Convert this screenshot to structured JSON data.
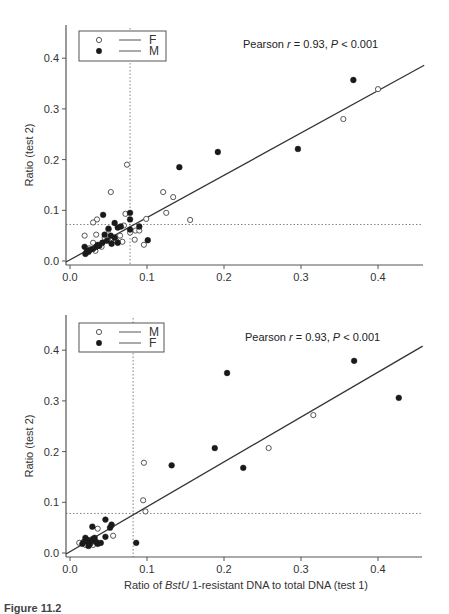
{
  "chart_data": [
    {
      "type": "scatter",
      "title": "",
      "annotation": "Pearson r = 0.93, P < 0.001",
      "annotation_parts": {
        "prefix": "Pearson ",
        "r": "r",
        "r_val": " = 0.93, ",
        "p": "P",
        "p_val": " < 0.001"
      },
      "xlabel": "",
      "ylabel": "Ratio (test 2)",
      "xlim": [
        0,
        0.46
      ],
      "ylim": [
        0,
        0.46
      ],
      "xticks": [
        "0.0",
        "0.1",
        "0.2",
        "0.3",
        "0.4"
      ],
      "yticks": [
        "0.0",
        "0.1",
        "0.2",
        "0.3",
        "0.4"
      ],
      "grid": false,
      "legend_position": "upper left",
      "legend": [
        {
          "label": "F",
          "marker": "open-circle"
        },
        {
          "label": "M",
          "marker": "filled-circle"
        }
      ],
      "cutoff_lines": {
        "x": 0.078,
        "y": 0.072
      },
      "regression_line": {
        "x0": 0.0,
        "y0": 0.0,
        "x1": 0.46,
        "y1": 0.386
      },
      "series": [
        {
          "name": "F",
          "marker": "open",
          "points": [
            [
              0.4,
              0.339
            ],
            [
              0.355,
              0.28
            ],
            [
              0.074,
              0.19
            ],
            [
              0.053,
              0.136
            ],
            [
              0.121,
              0.136
            ],
            [
              0.134,
              0.126
            ],
            [
              0.125,
              0.095
            ],
            [
              0.156,
              0.081
            ],
            [
              0.096,
              0.032
            ],
            [
              0.099,
              0.083
            ],
            [
              0.072,
              0.093
            ],
            [
              0.085,
              0.06
            ],
            [
              0.09,
              0.06
            ],
            [
              0.084,
              0.042
            ],
            [
              0.078,
              0.056
            ],
            [
              0.068,
              0.038
            ],
            [
              0.065,
              0.05
            ],
            [
              0.06,
              0.04
            ],
            [
              0.035,
              0.082
            ],
            [
              0.03,
              0.076
            ],
            [
              0.019,
              0.05
            ],
            [
              0.034,
              0.052
            ],
            [
              0.03,
              0.036
            ],
            [
              0.033,
              0.02
            ],
            [
              0.025,
              0.025
            ],
            [
              0.045,
              0.046
            ],
            [
              0.055,
              0.045
            ],
            [
              0.07,
              0.07
            ],
            [
              0.05,
              0.062
            ],
            [
              0.041,
              0.028
            ]
          ]
        },
        {
          "name": "M",
          "marker": "filled",
          "points": [
            [
              0.368,
              0.357
            ],
            [
              0.296,
              0.221
            ],
            [
              0.192,
              0.215
            ],
            [
              0.142,
              0.185
            ],
            [
              0.101,
              0.041
            ],
            [
              0.078,
              0.095
            ],
            [
              0.078,
              0.082
            ],
            [
              0.078,
              0.062
            ],
            [
              0.09,
              0.068
            ],
            [
              0.043,
              0.091
            ],
            [
              0.058,
              0.075
            ],
            [
              0.062,
              0.066
            ],
            [
              0.066,
              0.068
            ],
            [
              0.05,
              0.064
            ],
            [
              0.053,
              0.05
            ],
            [
              0.058,
              0.046
            ],
            [
              0.054,
              0.034
            ],
            [
              0.062,
              0.036
            ],
            [
              0.045,
              0.052
            ],
            [
              0.042,
              0.036
            ],
            [
              0.038,
              0.03
            ],
            [
              0.034,
              0.028
            ],
            [
              0.03,
              0.024
            ],
            [
              0.026,
              0.022
            ],
            [
              0.022,
              0.02
            ],
            [
              0.02,
              0.014
            ],
            [
              0.019,
              0.028
            ],
            [
              0.024,
              0.018
            ],
            [
              0.048,
              0.04
            ],
            [
              0.036,
              0.032
            ]
          ]
        }
      ]
    },
    {
      "type": "scatter",
      "title": "",
      "annotation": "Pearson r = 0.93, P < 0.001",
      "annotation_parts": {
        "prefix": "Pearson ",
        "r": "r",
        "r_val": " = 0.93, ",
        "p": "P",
        "p_val": " < 0.001"
      },
      "xlabel": "Ratio of BstU 1-resistant DNA to total DNA (test 1)",
      "xlabel_parts": {
        "prefix": "Ratio of ",
        "italic": "BstU",
        "suffix": " 1-resistant DNA to total DNA (test 1)"
      },
      "ylabel": "Ratio (test 2)",
      "xlim": [
        0,
        0.46
      ],
      "ylim": [
        0,
        0.46
      ],
      "xticks": [
        "0.0",
        "0.1",
        "0.2",
        "0.3",
        "0.4"
      ],
      "yticks": [
        "0.0",
        "0.1",
        "0.2",
        "0.3",
        "0.4"
      ],
      "grid": false,
      "legend_position": "upper left",
      "legend": [
        {
          "label": "M",
          "marker": "open-circle"
        },
        {
          "label": "F",
          "marker": "filled-circle"
        }
      ],
      "cutoff_lines": {
        "x": 0.082,
        "y": 0.078
      },
      "regression_line": {
        "x0": 0.0,
        "y0": 0.0,
        "x1": 0.458,
        "y1": 0.408
      },
      "series": [
        {
          "name": "M",
          "marker": "open",
          "points": [
            [
              0.316,
              0.272
            ],
            [
              0.258,
              0.207
            ],
            [
              0.096,
              0.178
            ],
            [
              0.095,
              0.104
            ],
            [
              0.098,
              0.082
            ],
            [
              0.056,
              0.034
            ],
            [
              0.036,
              0.048
            ],
            [
              0.054,
              0.054
            ],
            [
              0.012,
              0.02
            ],
            [
              0.02,
              0.016
            ],
            [
              0.03,
              0.016
            ],
            [
              0.026,
              0.026
            ],
            [
              0.034,
              0.02
            ]
          ]
        },
        {
          "name": "F",
          "marker": "filled",
          "points": [
            [
              0.369,
              0.379
            ],
            [
              0.204,
              0.355
            ],
            [
              0.427,
              0.306
            ],
            [
              0.188,
              0.207
            ],
            [
              0.132,
              0.173
            ],
            [
              0.225,
              0.168
            ],
            [
              0.086,
              0.02
            ],
            [
              0.046,
              0.066
            ],
            [
              0.029,
              0.052
            ],
            [
              0.052,
              0.05
            ],
            [
              0.054,
              0.056
            ],
            [
              0.046,
              0.032
            ],
            [
              0.02,
              0.03
            ],
            [
              0.022,
              0.026
            ],
            [
              0.024,
              0.022
            ],
            [
              0.026,
              0.018
            ],
            [
              0.028,
              0.024
            ],
            [
              0.03,
              0.028
            ],
            [
              0.032,
              0.03
            ],
            [
              0.034,
              0.022
            ],
            [
              0.036,
              0.018
            ],
            [
              0.04,
              0.02
            ],
            [
              0.016,
              0.018
            ],
            [
              0.018,
              0.022
            ],
            [
              0.024,
              0.014
            ]
          ]
        }
      ]
    }
  ],
  "caption": "Figure 11.2"
}
